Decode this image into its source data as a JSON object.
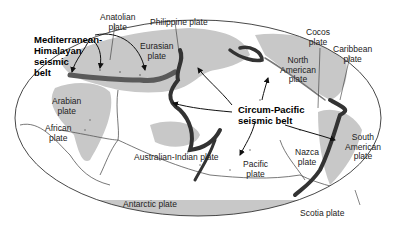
{
  "figure": {
    "type": "world map of tectonic plates and seismic belts",
    "colors": {
      "ocean": "#ffffff",
      "land": "#c8c8c8",
      "seismic": "#3a3a3a",
      "outline": "#444444",
      "text": "#222222"
    }
  },
  "belts": [
    {
      "label_lines": [
        "Mediterranean-",
        "Himalayan",
        "seismic",
        "belt"
      ]
    },
    {
      "label_lines": [
        "Circum-Pacific",
        "seismic belt"
      ]
    }
  ],
  "plates": [
    {
      "name": "anatolian",
      "lines": [
        "Anatolian",
        "plate"
      ]
    },
    {
      "name": "philippine",
      "lines": [
        "Philippine plate"
      ]
    },
    {
      "name": "eurasian",
      "lines": [
        "Eurasian",
        "plate"
      ]
    },
    {
      "name": "cocos",
      "lines": [
        "Cocos",
        "plate"
      ]
    },
    {
      "name": "caribbean",
      "lines": [
        "Caribbean",
        "plate"
      ]
    },
    {
      "name": "north-american",
      "lines": [
        "North",
        "American",
        "plate"
      ]
    },
    {
      "name": "arabian",
      "lines": [
        "Arabian",
        "plate"
      ]
    },
    {
      "name": "african",
      "lines": [
        "African",
        "plate"
      ]
    },
    {
      "name": "australian-indian",
      "lines": [
        "Australian-Indian plate"
      ]
    },
    {
      "name": "pacific",
      "lines": [
        "Pacific",
        "plate"
      ]
    },
    {
      "name": "nazca",
      "lines": [
        "Nazca",
        "plate"
      ]
    },
    {
      "name": "south-american",
      "lines": [
        "South",
        "American",
        "plate"
      ]
    },
    {
      "name": "antarctic",
      "lines": [
        "Antarctic plate"
      ]
    },
    {
      "name": "scotia",
      "lines": [
        "Scotia plate"
      ]
    }
  ]
}
